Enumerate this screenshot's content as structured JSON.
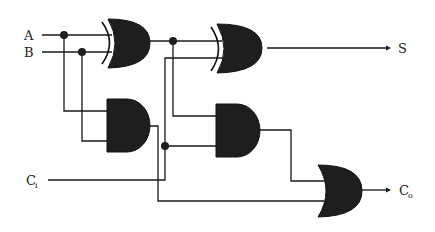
{
  "inputs": [
    {
      "id": "A",
      "label": "A"
    },
    {
      "id": "B",
      "label": "B"
    },
    {
      "id": "Ci",
      "label": "C",
      "subscript": "i"
    }
  ],
  "outputs": [
    {
      "id": "S",
      "label": "S"
    },
    {
      "id": "Co",
      "label": "C",
      "subscript": "o"
    }
  ],
  "gates": [
    {
      "id": "xor1",
      "type": "XOR",
      "inputs": [
        "A",
        "B"
      ]
    },
    {
      "id": "xor2",
      "type": "XOR",
      "inputs": [
        "xor1",
        "Ci"
      ],
      "output": "S"
    },
    {
      "id": "and1",
      "type": "AND",
      "inputs": [
        "A",
        "B"
      ]
    },
    {
      "id": "and2",
      "type": "AND",
      "inputs": [
        "xor1",
        "Ci"
      ]
    },
    {
      "id": "or1",
      "type": "OR",
      "inputs": [
        "and2",
        "and1"
      ],
      "output": "Co"
    }
  ],
  "colors": {
    "gate_fill": "#1e1e1e",
    "wire": "#1a1a1a",
    "background": "#ffffff"
  }
}
